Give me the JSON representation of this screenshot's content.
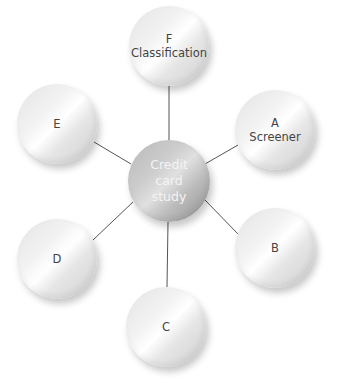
{
  "diagram": {
    "type": "hub-and-spoke",
    "center": {
      "lines": [
        "Credit",
        "card",
        "study"
      ],
      "x": 169,
      "y": 181,
      "r": 41
    },
    "nodes": [
      {
        "id": "F",
        "lines": [
          "F",
          "Classification"
        ],
        "x": 169,
        "y": 46,
        "r": 40
      },
      {
        "id": "A",
        "lines": [
          "A",
          "Screener"
        ],
        "x": 275,
        "y": 130,
        "r": 40
      },
      {
        "id": "B",
        "lines": [
          "B"
        ],
        "x": 275,
        "y": 248,
        "r": 40
      },
      {
        "id": "C",
        "lines": [
          "C"
        ],
        "x": 166,
        "y": 327,
        "r": 40
      },
      {
        "id": "D",
        "lines": [
          "D"
        ],
        "x": 57,
        "y": 259,
        "r": 40
      },
      {
        "id": "E",
        "lines": [
          "E"
        ],
        "x": 57,
        "y": 124,
        "r": 40
      }
    ],
    "connector_color": "#555555"
  }
}
